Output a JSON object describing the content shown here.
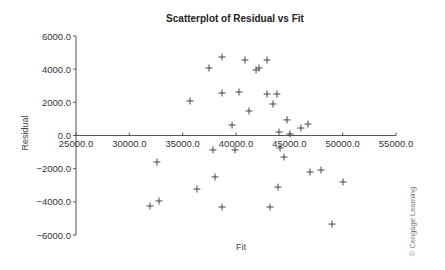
{
  "chart_data": {
    "type": "scatter",
    "title": "Scatterplot of Residual vs Fit",
    "xlabel": "Fit",
    "ylabel": "Residual",
    "xlim": [
      25000,
      55000
    ],
    "ylim": [
      -6000,
      6000
    ],
    "x_ticks": [
      25000,
      30000,
      35000,
      40000,
      45000,
      50000,
      55000
    ],
    "x_tick_labels": [
      "25000.0",
      "30000.0",
      "35000.0",
      "40000.0",
      "45000.0",
      "50000.0",
      "55000.0"
    ],
    "y_ticks": [
      6000,
      4000,
      2000,
      0,
      -2000,
      -4000,
      -6000
    ],
    "y_tick_labels": [
      "6000.0",
      "4000.0",
      "2000.0",
      "0.0",
      "-2000.0",
      "-4000.0",
      "-6000.0"
    ],
    "grid": false,
    "legend": null,
    "marker": "+",
    "points": [
      {
        "x": 37470,
        "y": 4070
      },
      {
        "x": 38690,
        "y": 4730
      },
      {
        "x": 40840,
        "y": 4550
      },
      {
        "x": 41880,
        "y": 3950
      },
      {
        "x": 42160,
        "y": 4070
      },
      {
        "x": 42910,
        "y": 4550
      },
      {
        "x": 35690,
        "y": 2080
      },
      {
        "x": 38690,
        "y": 2560
      },
      {
        "x": 40280,
        "y": 2620
      },
      {
        "x": 42910,
        "y": 2500
      },
      {
        "x": 43840,
        "y": 2500
      },
      {
        "x": 43470,
        "y": 1900
      },
      {
        "x": 41220,
        "y": 1480
      },
      {
        "x": 39630,
        "y": 630
      },
      {
        "x": 44780,
        "y": 940
      },
      {
        "x": 44030,
        "y": 210
      },
      {
        "x": 45060,
        "y": 90
      },
      {
        "x": 46090,
        "y": 450
      },
      {
        "x": 46750,
        "y": 690
      },
      {
        "x": 37840,
        "y": -870
      },
      {
        "x": 39910,
        "y": -870
      },
      {
        "x": 44130,
        "y": -750
      },
      {
        "x": 44500,
        "y": -1300
      },
      {
        "x": 32590,
        "y": -1600
      },
      {
        "x": 46940,
        "y": -2200
      },
      {
        "x": 47970,
        "y": -2080
      },
      {
        "x": 38030,
        "y": -2500
      },
      {
        "x": 36340,
        "y": -3230
      },
      {
        "x": 43940,
        "y": -3110
      },
      {
        "x": 50030,
        "y": -2800
      },
      {
        "x": 31940,
        "y": -4250
      },
      {
        "x": 32780,
        "y": -3950
      },
      {
        "x": 38690,
        "y": -4310
      },
      {
        "x": 43190,
        "y": -4310
      },
      {
        "x": 49000,
        "y": -5340
      }
    ]
  },
  "credit": "© Cengage Learning"
}
